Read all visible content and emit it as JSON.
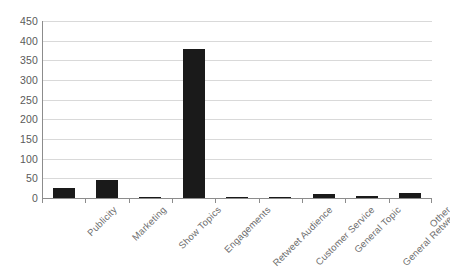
{
  "chart_data": {
    "type": "bar",
    "title": "",
    "subtitle": "",
    "xlabel": "",
    "ylabel": "",
    "categories": [
      "Publicity",
      "Marketing",
      "Show Topics",
      "Engagements",
      "Retweet Audience",
      "Customer Service",
      "General Topic",
      "General Retweets",
      "Other"
    ],
    "values": [
      26,
      47,
      2,
      380,
      0,
      3,
      10,
      5,
      13
    ],
    "ylim": [
      0,
      450
    ],
    "ytick_values": [
      0,
      50,
      100,
      150,
      200,
      250,
      300,
      350,
      400,
      450
    ],
    "ytick_labels": [
      "0",
      "50",
      "100",
      "150",
      "200",
      "250",
      "300",
      "350",
      "400",
      "450"
    ],
    "grid": "horizontal",
    "legend": "none",
    "bar_color": "#1a1a1a",
    "gridline_color": "#d9d9d9",
    "axis_color": "#8c8c8c",
    "tick_label_color": "#5a5a5a",
    "category_label_color": "#6e6e6e",
    "background_color": "#ffffff",
    "x_label_rotation_deg": -45
  }
}
